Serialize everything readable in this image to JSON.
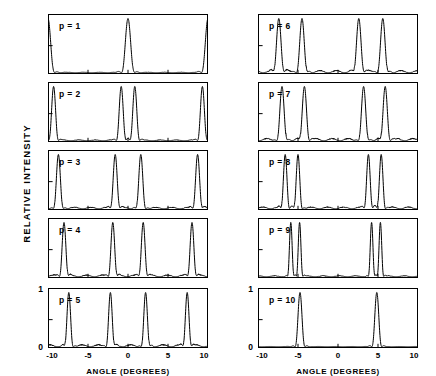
{
  "figure": {
    "ylabel": "RELATIVE INTENSITY",
    "xlabel_left": "ANGLE (DEGREES)",
    "xlabel_right": "ANGLE (DEGREES)",
    "y_tick_top": "1",
    "y_tick_bottom": "0"
  },
  "axis": {
    "xticks": [
      -10,
      -5,
      0,
      5,
      10
    ],
    "xtick_labels": [
      "-10",
      "-5",
      "0",
      "5",
      "10"
    ],
    "xlim": [
      -10,
      10
    ],
    "ylim": [
      0,
      1.06
    ],
    "yticks": [
      0,
      0.5,
      1
    ]
  },
  "panels": [
    {
      "label": "p = 1",
      "column": "left",
      "row": 0
    },
    {
      "label": "p = 2",
      "column": "left",
      "row": 1
    },
    {
      "label": "p = 3",
      "column": "left",
      "row": 2
    },
    {
      "label": "p = 4",
      "column": "left",
      "row": 3
    },
    {
      "label": "p = 5",
      "column": "left",
      "row": 4
    },
    {
      "label": "p = 6",
      "column": "right",
      "row": 0
    },
    {
      "label": "p = 7",
      "column": "right",
      "row": 1
    },
    {
      "label": "p = 8",
      "column": "right",
      "row": 2
    },
    {
      "label": "p = 9",
      "column": "right",
      "row": 3
    },
    {
      "label": "p = 10",
      "column": "right",
      "row": 4
    }
  ],
  "chart_data": {
    "type": "line",
    "title": "",
    "xlabel": "ANGLE (DEGREES)",
    "ylabel": "RELATIVE INTENSITY",
    "xlim": [
      -10,
      10
    ],
    "ylim": [
      0,
      1.06
    ],
    "xticks": [
      -10,
      -5,
      0,
      5,
      10
    ],
    "yticks": [
      0,
      1
    ],
    "grid": false,
    "legend": "none",
    "note": "Diffraction relative-intensity vs angle for parameter p = 1..10; each panel peaks normalized to 1.",
    "series": [
      {
        "name": "p = 1",
        "peak_positions": [
          -10.0,
          0.0,
          10.0
        ],
        "peak_heights": [
          1.0,
          1.0,
          1.0
        ],
        "peak_width": 0.82,
        "sidelobe_level": 0.012
      },
      {
        "name": "p = 2",
        "peak_positions": [
          -9.3,
          -0.85,
          0.85,
          9.3
        ],
        "peak_heights": [
          1.0,
          1.0,
          1.0,
          1.0
        ],
        "peak_width": 0.62,
        "sidelobe_level": 0.02
      },
      {
        "name": "p = 3",
        "peak_positions": [
          -8.7,
          -1.6,
          1.6,
          8.7
        ],
        "peak_heights": [
          1.0,
          1.0,
          1.0,
          1.0
        ],
        "peak_width": 0.62,
        "sidelobe_level": 0.035
      },
      {
        "name": "p = 4",
        "peak_positions": [
          -8.0,
          -1.9,
          1.9,
          8.0
        ],
        "peak_heights": [
          1.0,
          1.0,
          1.0,
          1.0
        ],
        "peak_width": 0.58,
        "sidelobe_level": 0.04
      },
      {
        "name": "p = 5",
        "peak_positions": [
          -7.4,
          -2.2,
          2.2,
          7.4
        ],
        "peak_heights": [
          1.0,
          1.0,
          1.0,
          1.0
        ],
        "peak_width": 0.56,
        "sidelobe_level": 0.045
      },
      {
        "name": "p = 6",
        "peak_positions": [
          -7.4,
          -4.5,
          2.6,
          5.6
        ],
        "peak_heights": [
          1.0,
          1.0,
          1.0,
          1.0
        ],
        "peak_width": 0.7,
        "sidelobe_level": 0.05
      },
      {
        "name": "p = 7",
        "peak_positions": [
          -7.0,
          -4.2,
          3.2,
          5.9
        ],
        "peak_heights": [
          1.0,
          1.0,
          1.0,
          1.0
        ],
        "peak_width": 0.66,
        "sidelobe_level": 0.05
      },
      {
        "name": "p = 8",
        "peak_positions": [
          -6.6,
          -5.0,
          3.8,
          5.4
        ],
        "peak_heights": [
          1.0,
          1.0,
          1.0,
          1.0
        ],
        "peak_width": 0.55,
        "sidelobe_level": 0.04
      },
      {
        "name": "p = 9",
        "peak_positions": [
          -5.9,
          -4.8,
          4.2,
          5.3
        ],
        "peak_heights": [
          1.0,
          1.0,
          1.0,
          1.0
        ],
        "peak_width": 0.42,
        "sidelobe_level": 0.022
      },
      {
        "name": "p = 10",
        "peak_positions": [
          -4.75,
          4.85
        ],
        "peak_heights": [
          1.0,
          1.0
        ],
        "peak_width": 0.62,
        "sidelobe_level": 0.006
      }
    ]
  }
}
